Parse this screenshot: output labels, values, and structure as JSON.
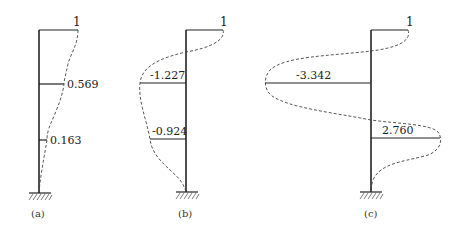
{
  "figure": {
    "panels": [
      {
        "id": "a",
        "caption": "(a)",
        "top_value": "1",
        "values": [
          "0.569",
          "0.163"
        ]
      },
      {
        "id": "b",
        "caption": "(b)",
        "top_value": "1",
        "values": [
          "-1.227",
          "-0.924"
        ]
      },
      {
        "id": "c",
        "caption": "(c)",
        "top_value": "1",
        "values": [
          "-3.342",
          "2.760"
        ]
      }
    ]
  }
}
